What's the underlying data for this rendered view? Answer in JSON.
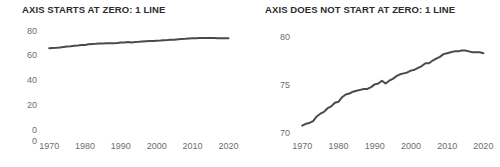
{
  "figure": {
    "background_color": "#ffffff",
    "line_color": "#4a4a4a",
    "tick_color": "#6e6e6e",
    "title_color": "#2b2b2b"
  },
  "panels": [
    {
      "id": "axis-starts-at-zero",
      "title": "AXIS STARTS AT ZERO: 1 LINE"
    },
    {
      "id": "axis-does-not-start-at-zero",
      "title": "AXIS DOES NOT START AT ZERO: 1 LINE"
    }
  ],
  "chart_data": [
    {
      "type": "line",
      "title": "AXIS STARTS AT ZERO: 1 LINE",
      "xlabel": "",
      "ylabel": "",
      "xlim": [
        1968,
        2021
      ],
      "ylim": [
        0,
        85
      ],
      "grid": false,
      "legend": null,
      "xticks": [
        1970,
        1980,
        1990,
        2000,
        2010,
        2020
      ],
      "xticklabels": [
        "1970",
        "1980",
        "1990",
        "2000",
        "2010",
        "2020"
      ],
      "yticks": [
        0,
        0,
        20,
        40,
        60,
        80
      ],
      "yticklabels": [
        "0",
        "0",
        "20",
        "40",
        "60",
        "80"
      ],
      "series": [
        {
          "name": "life expectancy",
          "x": [
            1970,
            1971,
            1972,
            1973,
            1974,
            1975,
            1976,
            1977,
            1978,
            1979,
            1980,
            1981,
            1982,
            1983,
            1984,
            1985,
            1986,
            1987,
            1988,
            1989,
            1990,
            1991,
            1992,
            1993,
            1994,
            1995,
            1996,
            1997,
            1998,
            1999,
            2000,
            2001,
            2002,
            2003,
            2004,
            2005,
            2006,
            2007,
            2008,
            2009,
            2010,
            2011,
            2012,
            2013,
            2014,
            2015,
            2016,
            2017,
            2018,
            2019,
            2020
          ],
          "values": [
            70.4,
            70.6,
            70.7,
            70.9,
            71.4,
            71.7,
            71.9,
            72.3,
            72.5,
            72.9,
            73.0,
            73.5,
            73.8,
            73.9,
            74.1,
            74.2,
            74.3,
            74.4,
            74.4,
            74.6,
            74.9,
            75.0,
            75.3,
            75.0,
            75.3,
            75.5,
            75.8,
            76.0,
            76.1,
            76.2,
            76.4,
            76.5,
            76.7,
            76.9,
            77.2,
            77.2,
            77.5,
            77.7,
            77.9,
            78.2,
            78.3,
            78.4,
            78.5,
            78.5,
            78.6,
            78.6,
            78.5,
            78.4,
            78.4,
            78.4,
            78.3
          ]
        }
      ]
    },
    {
      "type": "line",
      "title": "AXIS DOES NOT START AT ZERO: 1 LINE",
      "xlabel": "",
      "ylabel": "",
      "xlim": [
        1968,
        2021
      ],
      "ylim": [
        69.6,
        80.5
      ],
      "grid": false,
      "legend": null,
      "xticks": [
        1970,
        1980,
        1990,
        2000,
        2010,
        2020
      ],
      "xticklabels": [
        "1970",
        "1980",
        "1990",
        "2000",
        "2010",
        "2020"
      ],
      "yticks": [
        70,
        75,
        80
      ],
      "yticklabels": [
        "70",
        "75",
        "80"
      ],
      "series": [
        {
          "name": "life expectancy",
          "x": [
            1970,
            1971,
            1972,
            1973,
            1974,
            1975,
            1976,
            1977,
            1978,
            1979,
            1980,
            1981,
            1982,
            1983,
            1984,
            1985,
            1986,
            1987,
            1988,
            1989,
            1990,
            1991,
            1992,
            1993,
            1994,
            1995,
            1996,
            1997,
            1998,
            1999,
            2000,
            2001,
            2002,
            2003,
            2004,
            2005,
            2006,
            2007,
            2008,
            2009,
            2010,
            2011,
            2012,
            2013,
            2014,
            2015,
            2016,
            2017,
            2018,
            2019,
            2020
          ],
          "values": [
            70.4,
            70.6,
            70.7,
            70.9,
            71.4,
            71.7,
            71.9,
            72.3,
            72.5,
            72.9,
            73.0,
            73.5,
            73.8,
            73.9,
            74.1,
            74.2,
            74.3,
            74.4,
            74.4,
            74.6,
            74.9,
            75.0,
            75.3,
            75.0,
            75.3,
            75.5,
            75.8,
            76.0,
            76.1,
            76.2,
            76.4,
            76.5,
            76.7,
            76.9,
            77.2,
            77.2,
            77.5,
            77.7,
            77.9,
            78.2,
            78.3,
            78.4,
            78.5,
            78.5,
            78.6,
            78.6,
            78.5,
            78.4,
            78.4,
            78.4,
            78.3
          ]
        }
      ]
    }
  ]
}
